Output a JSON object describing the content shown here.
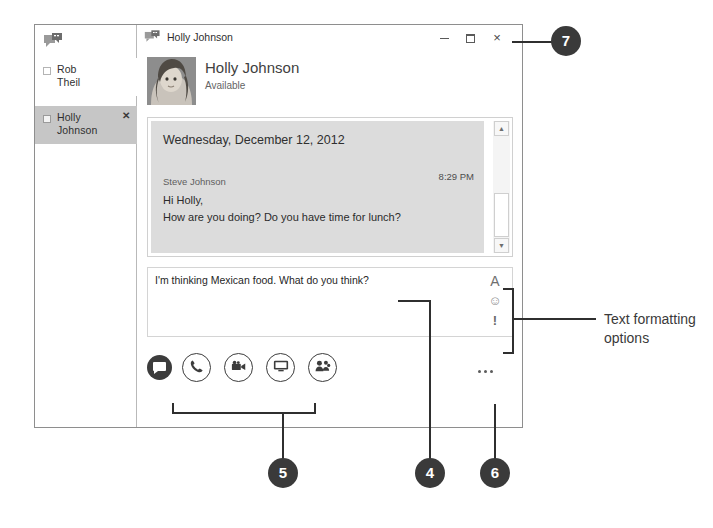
{
  "window": {
    "app_icon": "lync-conversation-icon",
    "title": "Holly Johnson",
    "controls": {
      "minimize": "minimize-button",
      "maximize": "maximize-button",
      "close_label": "×"
    }
  },
  "sidebar": {
    "app_icon": "lync-conversation-icon",
    "contacts": [
      {
        "name_line1": "Rob",
        "name_line2": "Theil",
        "selected": false,
        "presence": "away"
      },
      {
        "name_line1": "Holly",
        "name_line2": "Johnson",
        "selected": true,
        "presence": "available",
        "close_label": "✕"
      }
    ]
  },
  "contact_header": {
    "name": "Holly Johnson",
    "status": "Available",
    "avatar": "contact-photo"
  },
  "conversation": {
    "date_header": "Wednesday, December 12, 2012",
    "messages": [
      {
        "sender": "Steve Johnson",
        "time": "8:29 PM",
        "lines": [
          "Hi Holly,",
          "How are you doing? Do you have time for lunch?"
        ]
      }
    ],
    "scrollbar": {
      "up_arrow": "▲",
      "down_arrow": "▼"
    }
  },
  "compose": {
    "text": "I'm thinking Mexican food. What do you think?",
    "placeholder": "",
    "format_options": [
      {
        "id": "font",
        "label": "A",
        "name": "font-icon"
      },
      {
        "id": "emoticon",
        "label": "☺",
        "name": "emoticon-icon"
      },
      {
        "id": "importance",
        "label": "!",
        "name": "high-importance-icon"
      }
    ]
  },
  "action_bar": {
    "im_button": "instant-message-icon",
    "buttons": [
      {
        "id": "call",
        "name": "phone-icon"
      },
      {
        "id": "video",
        "name": "video-camera-icon"
      },
      {
        "id": "present",
        "name": "present-monitor-icon"
      },
      {
        "id": "people",
        "name": "add-participants-icon"
      }
    ],
    "more_options": "more-options-icon"
  },
  "annotations": {
    "callouts": [
      {
        "id": "7",
        "label": "7"
      },
      {
        "id": "5",
        "label": "5"
      },
      {
        "id": "4",
        "label": "4"
      },
      {
        "id": "6",
        "label": "6"
      }
    ],
    "labels": {
      "text_formatting": "Text formatting options"
    }
  },
  "colors": {
    "callout_fill": "#3a3a3a",
    "selected_contact": "#c6c6c6",
    "message_bubble": "#dcdcdc",
    "window_border": "#8e8e8e"
  }
}
